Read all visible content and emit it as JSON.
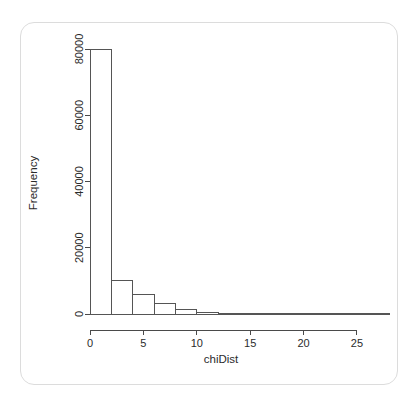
{
  "chart_data": {
    "type": "bar",
    "subtype": "histogram",
    "title": "",
    "xlabel": "chiDist",
    "ylabel": "Frequency",
    "xlim": [
      0,
      28
    ],
    "ylim": [
      0,
      80000
    ],
    "grid": false,
    "legend": null,
    "bin_width": 2,
    "x_ticks": [
      0,
      5,
      10,
      15,
      20,
      25
    ],
    "x_tick_labels": [
      "0",
      "5",
      "10",
      "15",
      "20",
      "25"
    ],
    "y_ticks": [
      0,
      20000,
      40000,
      60000,
      80000
    ],
    "y_tick_labels": [
      "0",
      "20000",
      "40000",
      "60000",
      "80000"
    ],
    "bin_edges": [
      0,
      2,
      4,
      6,
      8,
      10,
      12,
      14,
      16,
      18,
      20,
      22,
      24,
      26,
      28
    ],
    "values": [
      80000,
      10200,
      6000,
      3200,
      1500,
      600,
      250,
      90,
      30,
      10,
      4,
      2,
      1,
      0
    ],
    "bars": [
      {
        "x0": 0,
        "x1": 2,
        "count": 80000
      },
      {
        "x0": 2,
        "x1": 4,
        "count": 10200
      },
      {
        "x0": 4,
        "x1": 6,
        "count": 6000
      },
      {
        "x0": 6,
        "x1": 8,
        "count": 3200
      },
      {
        "x0": 8,
        "x1": 10,
        "count": 1500
      },
      {
        "x0": 10,
        "x1": 12,
        "count": 600
      },
      {
        "x0": 12,
        "x1": 14,
        "count": 250
      },
      {
        "x0": 14,
        "x1": 16,
        "count": 90
      },
      {
        "x0": 16,
        "x1": 18,
        "count": 30
      },
      {
        "x0": 18,
        "x1": 20,
        "count": 10
      },
      {
        "x0": 20,
        "x1": 22,
        "count": 4
      },
      {
        "x0": 22,
        "x1": 24,
        "count": 2
      },
      {
        "x0": 24,
        "x1": 26,
        "count": 1
      },
      {
        "x0": 26,
        "x1": 28,
        "count": 0
      }
    ],
    "colors": {
      "bar_fill": "#ffffff",
      "bar_stroke": "#555555",
      "axis": "#4a4a4a",
      "text": "#2b2b2b",
      "frame": "#dcdcdc",
      "background": "#ffffff"
    }
  }
}
